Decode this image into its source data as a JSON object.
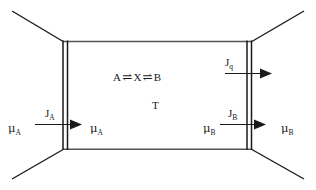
{
  "figure": {
    "name": "reaction-chamber-flux-diagram",
    "type": "thermodynamics-schematic",
    "background_color": "#ffffff",
    "line_color": "#1a1a1a"
  },
  "chamber": {
    "name": "reaction-chamber",
    "temperature_label": "T",
    "reaction": {
      "left_species": "A",
      "equilibrium_arrow_1": "⇌",
      "intermediate_species": "X",
      "equilibrium_arrow_2": "⇌",
      "right_species": "B"
    }
  },
  "left_wall": {
    "name": "left-membrane-wall",
    "outside_potential_base": "μ",
    "outside_potential_sub": "A",
    "inside_potential_base": "μ",
    "inside_potential_sub": "A",
    "flux_base": "J",
    "flux_sub": "A"
  },
  "right_wall": {
    "name": "right-membrane-wall",
    "inside_potential_base": "μ",
    "inside_potential_sub": "B",
    "outside_potential_base": "μ",
    "outside_potential_sub": "B",
    "flux_base": "J",
    "flux_sub": "B",
    "heat_flux_base": "J",
    "heat_flux_sub": "q"
  }
}
